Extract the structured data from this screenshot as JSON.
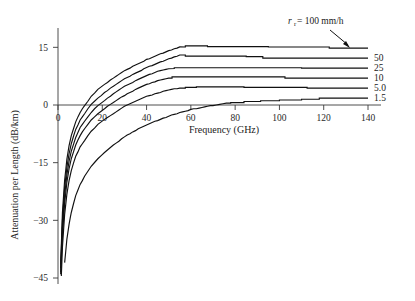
{
  "chart_data": {
    "type": "line",
    "title": "",
    "xlabel": "Frequency (GHz)",
    "ylabel": "Attenuation per Length (dB/km)",
    "xlim": [
      0,
      145
    ],
    "ylim": [
      -45,
      18
    ],
    "xticks": [
      0,
      20,
      40,
      60,
      80,
      100,
      120,
      140
    ],
    "xtick_labels": [
      "0",
      "20",
      "40",
      "60",
      "80",
      "100",
      "120",
      "140"
    ],
    "yticks": [
      15,
      0,
      -15,
      -30,
      -45
    ],
    "ytick_labels": [
      "15",
      "0",
      "−15",
      "−30",
      "−45"
    ],
    "grid": false,
    "legend_position": "right-end-labels",
    "annotation": {
      "text": "r_r = 100 mm/h",
      "var": "r",
      "sub": "r",
      "eq": " = 100 mm/h",
      "points_to_series": "100"
    },
    "series": [
      {
        "name": "100",
        "label": "",
        "rain_rate_mm_per_h": 100,
        "plateau": 14.8,
        "x": [
          1.2,
          2,
          3,
          4,
          5,
          6,
          8,
          10,
          12,
          15,
          18,
          21,
          25,
          30,
          35,
          40,
          45,
          50,
          55,
          60,
          65,
          70,
          80,
          90,
          100,
          110,
          120,
          125,
          130,
          140
        ],
        "y": [
          -41.5,
          -28.0,
          -19.5,
          -14.2,
          -10.6,
          -8.0,
          -4.4,
          -1.9,
          -0.1,
          2.2,
          4.0,
          5.4,
          7.0,
          8.9,
          10.4,
          11.8,
          13.0,
          14.1,
          15.1,
          15.4,
          15.4,
          15.2,
          15.2,
          15.2,
          15.1,
          15.1,
          15.1,
          14.8,
          14.8,
          14.8
        ]
      },
      {
        "name": "50",
        "label": "50",
        "rain_rate_mm_per_h": 50,
        "plateau": 12.2,
        "x": [
          1.2,
          2,
          3,
          4,
          5,
          6,
          8,
          10,
          12,
          15,
          18,
          21,
          25,
          30,
          35,
          40,
          45,
          50,
          55,
          60,
          70,
          80,
          90,
          95,
          100,
          120,
          140
        ],
        "y": [
          -42.5,
          -30.0,
          -21.5,
          -16.2,
          -12.6,
          -10.0,
          -6.4,
          -3.9,
          -2.2,
          0.1,
          1.8,
          3.2,
          4.9,
          6.8,
          8.3,
          9.7,
          10.9,
          12.0,
          13.0,
          12.7,
          12.7,
          12.7,
          12.6,
          12.2,
          12.2,
          12.2,
          12.2
        ]
      },
      {
        "name": "25",
        "label": "25",
        "rain_rate_mm_per_h": 25,
        "plateau": 9.6,
        "x": [
          1.2,
          2,
          3,
          4,
          5,
          6,
          8,
          10,
          12,
          15,
          18,
          21,
          25,
          30,
          35,
          40,
          45,
          50,
          55,
          60,
          80,
          100,
          120,
          140
        ],
        "y": [
          -43.5,
          -32.0,
          -23.5,
          -18.2,
          -14.6,
          -12.0,
          -8.4,
          -5.9,
          -4.2,
          -1.9,
          -0.2,
          1.2,
          2.9,
          4.8,
          6.3,
          7.7,
          8.7,
          9.5,
          9.7,
          9.7,
          9.7,
          9.7,
          9.6,
          9.6
        ]
      },
      {
        "name": "10",
        "label": "10",
        "rain_rate_mm_per_h": 10,
        "plateau": 7.0,
        "x": [
          1.2,
          2,
          3,
          4,
          5,
          6,
          8,
          10,
          12,
          15,
          18,
          21,
          25,
          30,
          35,
          40,
          45,
          50,
          53,
          60,
          70,
          80,
          90,
          100,
          105,
          120,
          140
        ],
        "y": [
          -44.0,
          -34.0,
          -25.5,
          -20.2,
          -16.6,
          -14.0,
          -10.4,
          -7.9,
          -6.2,
          -3.9,
          -2.2,
          -0.9,
          0.7,
          2.5,
          4.0,
          5.3,
          6.3,
          7.0,
          7.3,
          7.3,
          7.3,
          7.3,
          7.3,
          7.3,
          7.0,
          7.0,
          7.0
        ]
      },
      {
        "name": "5.0",
        "label": "5.0",
        "rain_rate_mm_per_h": 5.0,
        "plateau": 4.4,
        "x": [
          1.5,
          2,
          3,
          4,
          5,
          6,
          8,
          10,
          12,
          15,
          18,
          21,
          25,
          30,
          35,
          40,
          45,
          50,
          55,
          60,
          65,
          70,
          80,
          88,
          100,
          110,
          115,
          130,
          140
        ],
        "y": [
          -44.5,
          -37.0,
          -28.5,
          -23.2,
          -19.6,
          -17.0,
          -13.4,
          -10.9,
          -9.2,
          -6.8,
          -5.1,
          -3.8,
          -2.2,
          -0.4,
          1.0,
          2.2,
          3.1,
          3.9,
          4.4,
          4.6,
          4.7,
          4.7,
          4.7,
          4.6,
          4.6,
          4.6,
          4.4,
          4.4,
          4.4
        ]
      },
      {
        "name": "1.5",
        "label": "1.5",
        "rain_rate_mm_per_h": 1.5,
        "plateau": 1.8,
        "x": [
          3,
          4,
          5,
          6,
          8,
          10,
          12,
          15,
          18,
          21,
          25,
          30,
          35,
          40,
          45,
          50,
          55,
          60,
          65,
          70,
          76,
          80,
          88,
          95,
          105,
          115,
          121,
          130,
          140
        ],
        "y": [
          -41.0,
          -35.0,
          -31.0,
          -28.0,
          -23.5,
          -20.6,
          -18.6,
          -16.0,
          -14.0,
          -12.3,
          -10.4,
          -8.3,
          -6.6,
          -5.2,
          -4.0,
          -2.9,
          -2.0,
          -1.2,
          -0.6,
          -0.1,
          0.5,
          0.6,
          0.9,
          1.1,
          1.3,
          1.5,
          1.8,
          1.8,
          1.8
        ]
      }
    ]
  }
}
